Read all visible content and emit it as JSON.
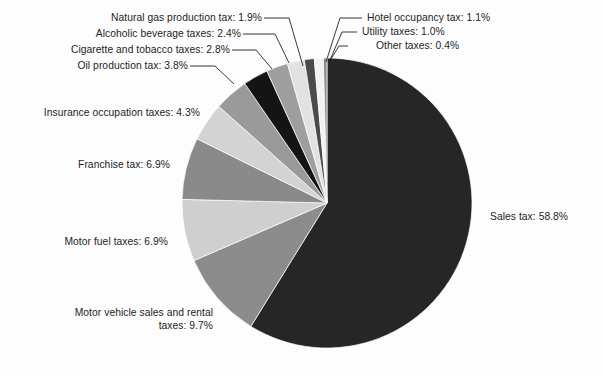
{
  "chart_data": {
    "type": "pie",
    "title": "",
    "subtitle": "",
    "xlabel": "",
    "ylabel": "",
    "legend_position": "none",
    "grid": false,
    "units": "percent",
    "start_angle_deg": 0,
    "direction": "clockwise",
    "categories": [
      "Sales tax",
      "Motor vehicle sales and rental taxes",
      "Motor fuel taxes",
      "Franchise tax",
      "Insurance occupation taxes",
      "Oil production tax",
      "Cigarette and tobacco taxes",
      "Alcoholic beverage taxes",
      "Natural gas production tax",
      "Hotel occupancy tax",
      "Utility taxes",
      "Other taxes"
    ],
    "values": [
      58.8,
      9.7,
      6.9,
      6.9,
      4.3,
      3.8,
      2.8,
      2.4,
      1.9,
      1.1,
      1.0,
      0.4
    ],
    "slice_colors": [
      "#262626",
      "#8c8c8c",
      "#cfcfcf",
      "#8a8a8a",
      "#d3d3d3",
      "#9a9a9a",
      "#141414",
      "#9e9e9e",
      "#e2e2e2",
      "#4a4a4a",
      "#f2f2f2",
      "#8f8f8f"
    ],
    "slices": [
      {
        "label": "Sales tax: 58.8%",
        "name": "Sales tax",
        "value": 58.8,
        "color": "#262626"
      },
      {
        "label": "Motor vehicle sales and rental taxes: 9.7%",
        "name": "Motor vehicle sales and rental taxes",
        "value": 9.7,
        "color": "#8c8c8c"
      },
      {
        "label": "Motor fuel taxes: 6.9%",
        "name": "Motor fuel taxes",
        "value": 6.9,
        "color": "#cfcfcf"
      },
      {
        "label": "Franchise tax: 6.9%",
        "name": "Franchise tax",
        "value": 6.9,
        "color": "#8a8a8a"
      },
      {
        "label": "Insurance occupation taxes: 4.3%",
        "name": "Insurance occupation taxes",
        "value": 4.3,
        "color": "#d3d3d3"
      },
      {
        "label": "Oil production tax: 3.8%",
        "name": "Oil production tax",
        "value": 3.8,
        "color": "#9a9a9a"
      },
      {
        "label": "Cigarette and tobacco taxes: 2.8%",
        "name": "Cigarette and tobacco taxes",
        "value": 2.8,
        "color": "#141414"
      },
      {
        "label": "Alcoholic beverage taxes: 2.4%",
        "name": "Alcoholic beverage taxes",
        "value": 2.4,
        "color": "#9e9e9e"
      },
      {
        "label": "Natural gas production tax: 1.9%",
        "name": "Natural gas production tax",
        "value": 1.9,
        "color": "#e2e2e2"
      },
      {
        "label": "Hotel occupancy tax: 1.1%",
        "name": "Hotel occupancy tax",
        "value": 1.1,
        "color": "#4a4a4a"
      },
      {
        "label": "Utility taxes: 1.0%",
        "name": "Utility taxes",
        "value": 1.0,
        "color": "#f2f2f2"
      },
      {
        "label": "Other taxes: 0.4%",
        "name": "Other taxes",
        "value": 0.4,
        "color": "#8f8f8f"
      }
    ]
  },
  "labels": {
    "natural_gas": "Natural gas production tax: 1.9%",
    "alcoholic": "Alcoholic beverage taxes: 2.4%",
    "cigarette": "Cigarette and tobacco taxes: 2.8%",
    "oil": "Oil production tax: 3.8%",
    "insurance": "Insurance occupation taxes: 4.3%",
    "franchise": "Franchise tax: 6.9%",
    "motor_fuel": "Motor fuel taxes: 6.9%",
    "motor_vehicle": "Motor vehicle sales and rental taxes: 9.7%",
    "hotel": "Hotel occupancy tax: 1.1%",
    "utility": "Utility taxes: 1.0%",
    "other": "Other taxes: 0.4%",
    "sales": "Sales tax: 58.8%"
  }
}
